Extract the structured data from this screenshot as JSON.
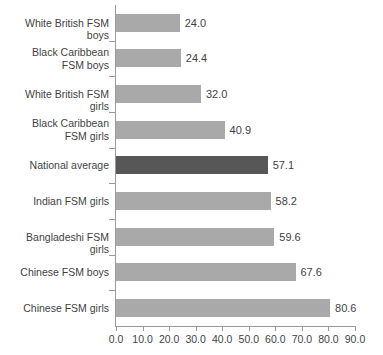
{
  "chart_data": {
    "type": "bar",
    "orientation": "horizontal",
    "title": "",
    "subtitle": "",
    "xlabel": "",
    "ylabel": "",
    "xlim": [
      0.0,
      90.0
    ],
    "xticks": [
      "0.0",
      "10.0",
      "20.0",
      "30.0",
      "40.0",
      "50.0",
      "60.0",
      "70.0",
      "80.0",
      "90.0"
    ],
    "xtick_values": [
      0,
      10,
      20,
      30,
      40,
      50,
      60,
      70,
      80,
      90
    ],
    "grid": false,
    "legend": "none",
    "categories": [
      "White British FSM boys",
      "Black Caribbean\nFSM boys",
      "White British FSM girls",
      "Black Caribbean\nFSM girls",
      "National average",
      "Indian FSM girls",
      "Bangladeshi FSM girls",
      "Chinese FSM boys",
      "Chinese FSM girls"
    ],
    "values": [
      24.0,
      24.4,
      32.0,
      40.9,
      57.1,
      58.2,
      59.6,
      67.6,
      80.6
    ],
    "value_labels": [
      "24.0",
      "24.4",
      "32.0",
      "40.9",
      "57.1",
      "58.2",
      "59.6",
      "67.6",
      "80.6"
    ],
    "highlight_index": 4,
    "colors": {
      "bar": "#a9a9a9",
      "bar_highlight": "#575757",
      "axis": "#9a9a9a",
      "text": "#3f3f3f",
      "background": "#ffffff"
    }
  }
}
